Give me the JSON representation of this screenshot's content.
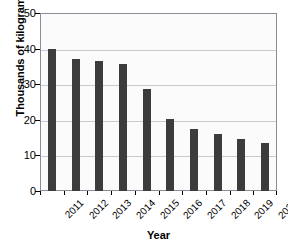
{
  "chart_data": {
    "type": "bar",
    "title": "",
    "xlabel": "Year",
    "ylabel": "Thousands of kilograms",
    "categories": [
      "2011",
      "2012",
      "2013",
      "2014",
      "2015",
      "2016",
      "2017",
      "2018",
      "2019",
      "2020"
    ],
    "values": [
      40.0,
      37.0,
      36.4,
      35.7,
      28.6,
      20.2,
      17.3,
      15.9,
      14.5,
      13.4
    ],
    "ylim": [
      0,
      50
    ],
    "yticks": [
      0,
      10,
      20,
      30,
      40,
      50
    ],
    "ytick_labels": [
      "0",
      "10",
      "20",
      "30",
      "40",
      "50"
    ],
    "grid": true,
    "grid_axis": "y",
    "legend": "none",
    "bar_color": "#3c3c3c",
    "plot_background": "#fbfbfb",
    "gridline_color": "#c9c9d2",
    "axis_color": "#8c8c99",
    "xtick_rotation": -45
  },
  "watermark": {
    "line_top": "",
    "line_bottom": ""
  }
}
